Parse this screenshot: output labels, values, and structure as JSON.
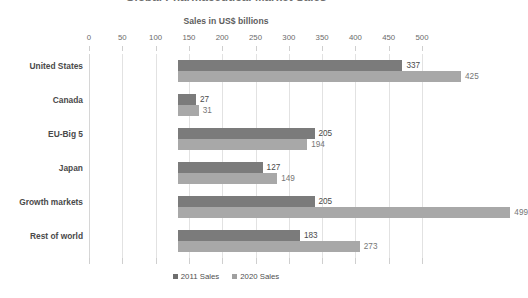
{
  "chart_data": {
    "type": "bar",
    "orientation": "horizontal",
    "title": "Global Pharmaceutical Market Sales",
    "subtitle": "Sales in US$ billions",
    "xlabel": "",
    "ylabel": "",
    "xlim": [
      0,
      500
    ],
    "xtick_step": 50,
    "xticks": [
      0,
      50,
      100,
      150,
      200,
      250,
      300,
      350,
      400,
      450,
      500
    ],
    "grid": true,
    "grid_axis": "x",
    "legend_position": "bottom",
    "categories": [
      "United States",
      "Canada",
      "EU-Big 5",
      "Japan",
      "Growth markets",
      "Rest of world"
    ],
    "series": [
      {
        "name": "2011 Sales",
        "color": "#7b7b7b",
        "values": [
          337,
          27,
          205,
          127,
          205,
          183
        ]
      },
      {
        "name": "2020 Sales",
        "color": "#a8a8a8",
        "values": [
          425,
          31,
          194,
          149,
          499,
          273
        ]
      }
    ],
    "data_labels": [
      [
        "337",
        "425"
      ],
      [
        "27",
        "31"
      ],
      [
        "205",
        "194"
      ],
      [
        "127",
        "149"
      ],
      [
        "205",
        "499"
      ],
      [
        "183",
        "273"
      ]
    ]
  }
}
